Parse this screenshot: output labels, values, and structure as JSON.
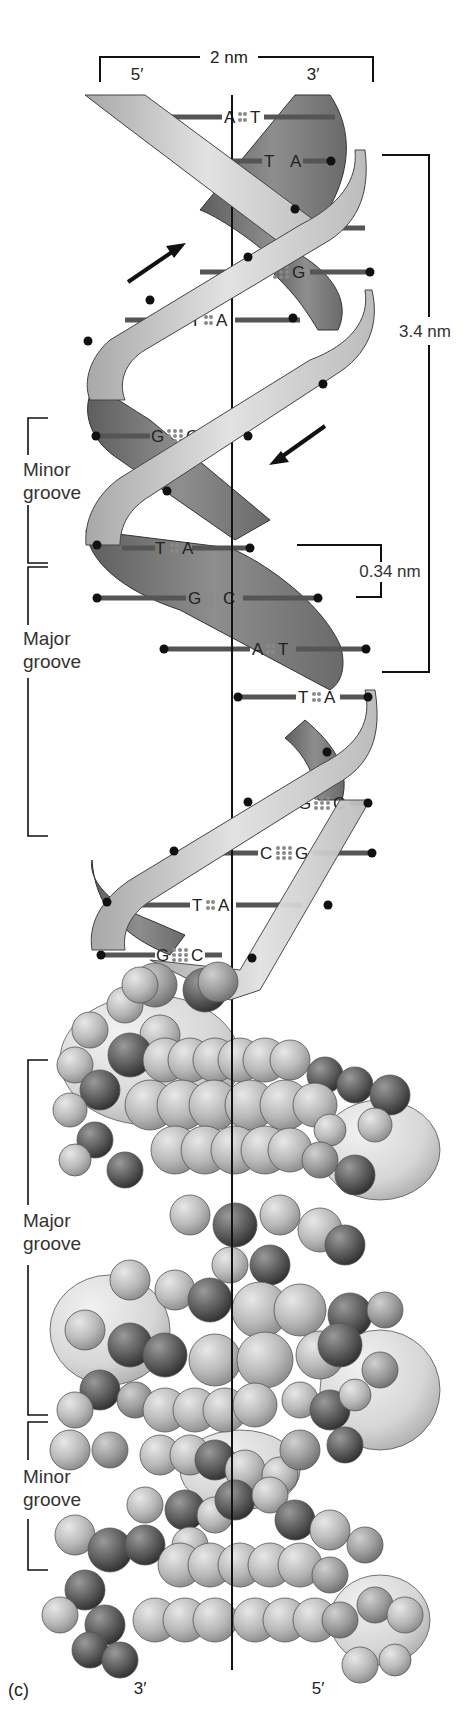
{
  "figure": {
    "panel_label": "(c)",
    "width_label": "2 nm",
    "top_strand_ends": {
      "left": "5′",
      "right": "3′"
    },
    "bottom_strand_ends": {
      "left": "3′",
      "right": "5′"
    },
    "helical_turn_label": "3.4 nm",
    "base_spacing_label": "0.34 nm",
    "upper_grooves": [
      {
        "line1": "Minor",
        "line2": "groove"
      },
      {
        "line1": "Major",
        "line2": "groove"
      }
    ],
    "lower_grooves": [
      {
        "line1": "Major",
        "line2": "groove"
      },
      {
        "line1": "Minor",
        "line2": "groove"
      }
    ],
    "base_pairs": [
      {
        "left": "A",
        "right": "T",
        "bonds": 2
      },
      {
        "left": "T",
        "right": "A",
        "bonds": 2
      },
      {
        "left": "G",
        "right": "C",
        "bonds": 3
      },
      {
        "left": "C",
        "right": "G",
        "bonds": 3
      },
      {
        "left": "T",
        "right": "A",
        "bonds": 2
      },
      {
        "left": "G",
        "right": "C",
        "bonds": 3
      },
      {
        "left": "T",
        "right": "A",
        "bonds": 2
      },
      {
        "left": "G",
        "right": "C",
        "bonds": 3
      },
      {
        "left": "A",
        "right": "T",
        "bonds": 2
      },
      {
        "left": "T",
        "right": "A",
        "bonds": 2
      },
      {
        "left": "G",
        "right": "C",
        "bonds": 3
      },
      {
        "left": "C",
        "right": "G",
        "bonds": 3
      },
      {
        "left": "T",
        "right": "A",
        "bonds": 2
      },
      {
        "left": "G",
        "right": "C",
        "bonds": 3
      }
    ],
    "colors": {
      "ribbon_front": "#d4d4d4",
      "ribbon_back": "#7a7a7a",
      "ink": "#111111",
      "base_bar": "#555555",
      "hbond_dots": "#8a8a8a"
    }
  }
}
